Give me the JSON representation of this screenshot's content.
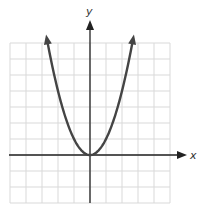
{
  "chart_data": {
    "type": "line",
    "title": "",
    "function": "y = x^2",
    "xlabel": "x",
    "ylabel": "y",
    "xlim": [
      -5,
      5
    ],
    "ylim": [
      -3,
      7
    ],
    "grid": true,
    "legend": null,
    "series": [
      {
        "name": "y = x^2",
        "x": [
          -2.7,
          -2.5,
          -2,
          -1.5,
          -1,
          -0.5,
          0,
          0.5,
          1,
          1.5,
          2,
          2.5,
          2.7
        ],
        "y": [
          7.29,
          6.25,
          4,
          2.25,
          1,
          0.25,
          0,
          0.25,
          1,
          2.25,
          4,
          6.25,
          7.29
        ],
        "color": "#444444",
        "arrows_at_ends": true
      }
    ]
  },
  "axes": {
    "x_label": "x",
    "y_label": "y"
  },
  "colors": {
    "grid": "#d9d9d9",
    "axis": "#222222",
    "curve": "#444444"
  }
}
